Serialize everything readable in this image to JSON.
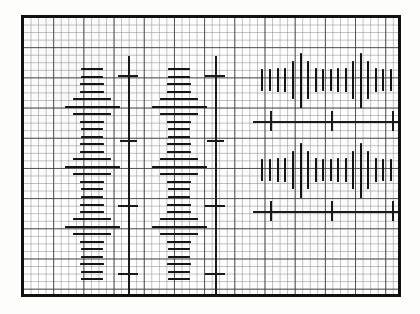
{
  "figure": {
    "title": "Graph-paper bar chart with diamond-shaped bar clusters",
    "background_color": "#ffffff",
    "ink_color": "#141414",
    "frame_color": "#111111",
    "grid_minor_color": "#8c8c8c",
    "grid_major_color": "#3c3c3c",
    "grid_minor_step_px": 7.55,
    "grid_major_step_px": 30.2,
    "plot_left_px": 21,
    "plot_top_px": 15,
    "plot_width_px": 380,
    "plot_height_px": 282
  },
  "chart_data": {
    "type": "bar",
    "title": "Graph-paper bar chart with diamond-shaped bar clusters",
    "subtitle": "",
    "xlabel": "",
    "ylabel": "",
    "grid": true,
    "legend": "none",
    "xlim": [
      0,
      380
    ],
    "ylim": [
      0,
      282
    ],
    "panels": [
      {
        "name": "left-column-1",
        "orientation": "horizontal",
        "center_x": 68,
        "clusters": [
          {
            "name": "cluster-A1",
            "center_y": 78,
            "bars": [
              {
                "y": 50,
                "length": 22
              },
              {
                "y": 58,
                "length": 22
              },
              {
                "y": 65,
                "length": 24
              },
              {
                "y": 73,
                "length": 24
              },
              {
                "y": 80,
                "length": 38
              },
              {
                "y": 88,
                "length": 55
              },
              {
                "y": 95,
                "length": 38
              },
              {
                "y": 103,
                "length": 24
              },
              {
                "y": 110,
                "length": 22
              },
              {
                "y": 118,
                "length": 22
              },
              {
                "y": 125,
                "length": 24
              },
              {
                "y": 133,
                "length": 24
              }
            ]
          },
          {
            "name": "cluster-A2",
            "center_y": 148,
            "bars": [
              {
                "y": 140,
                "length": 38
              },
              {
                "y": 148,
                "length": 55
              },
              {
                "y": 155,
                "length": 38
              },
              {
                "y": 163,
                "length": 24
              },
              {
                "y": 170,
                "length": 22
              },
              {
                "y": 178,
                "length": 22
              }
            ]
          },
          {
            "name": "cluster-A3",
            "center_y": 208,
            "bars": [
              {
                "y": 186,
                "length": 24
              },
              {
                "y": 193,
                "length": 24
              },
              {
                "y": 200,
                "length": 38
              },
              {
                "y": 208,
                "length": 55
              },
              {
                "y": 215,
                "length": 38
              },
              {
                "y": 223,
                "length": 24
              },
              {
                "y": 230,
                "length": 22
              },
              {
                "y": 238,
                "length": 22
              },
              {
                "y": 245,
                "length": 24
              },
              {
                "y": 253,
                "length": 22
              },
              {
                "y": 260,
                "length": 22
              }
            ]
          }
        ],
        "axis": {
          "name": "axis-left-1",
          "x": 104,
          "y_top": 38,
          "y_bottom": 281,
          "ticks": [
            {
              "y": 57,
              "length": 20
            },
            {
              "y": 122,
              "length": 17
            },
            {
              "y": 187,
              "length": 20
            },
            {
              "y": 255,
              "length": 20
            }
          ]
        }
      },
      {
        "name": "left-column-2",
        "orientation": "horizontal",
        "center_x": 155,
        "clusters": [
          {
            "name": "cluster-B1",
            "center_y": 78,
            "bars": [
              {
                "y": 50,
                "length": 22
              },
              {
                "y": 58,
                "length": 22
              },
              {
                "y": 65,
                "length": 24
              },
              {
                "y": 73,
                "length": 24
              },
              {
                "y": 80,
                "length": 38
              },
              {
                "y": 88,
                "length": 55
              },
              {
                "y": 95,
                "length": 38
              },
              {
                "y": 103,
                "length": 24
              },
              {
                "y": 110,
                "length": 22
              },
              {
                "y": 118,
                "length": 22
              },
              {
                "y": 125,
                "length": 24
              },
              {
                "y": 133,
                "length": 24
              }
            ]
          },
          {
            "name": "cluster-B2",
            "center_y": 148,
            "bars": [
              {
                "y": 140,
                "length": 38
              },
              {
                "y": 148,
                "length": 55
              },
              {
                "y": 155,
                "length": 38
              },
              {
                "y": 163,
                "length": 24
              },
              {
                "y": 170,
                "length": 22
              },
              {
                "y": 178,
                "length": 22
              }
            ]
          },
          {
            "name": "cluster-B3",
            "center_y": 208,
            "bars": [
              {
                "y": 186,
                "length": 24
              },
              {
                "y": 193,
                "length": 24
              },
              {
                "y": 200,
                "length": 38
              },
              {
                "y": 208,
                "length": 55
              },
              {
                "y": 215,
                "length": 38
              },
              {
                "y": 223,
                "length": 24
              },
              {
                "y": 230,
                "length": 22
              },
              {
                "y": 238,
                "length": 22
              },
              {
                "y": 245,
                "length": 24
              },
              {
                "y": 253,
                "length": 22
              },
              {
                "y": 260,
                "length": 22
              }
            ]
          }
        ],
        "axis": {
          "name": "axis-left-2",
          "x": 191,
          "y_top": 38,
          "y_bottom": 281,
          "ticks": [
            {
              "y": 57,
              "length": 20
            },
            {
              "y": 122,
              "length": 17
            },
            {
              "y": 187,
              "length": 20
            },
            {
              "y": 255,
              "length": 20
            }
          ]
        }
      },
      {
        "name": "right-row-1",
        "orientation": "vertical",
        "center_y": 62,
        "clusters": [
          {
            "name": "cluster-C1",
            "center_x": 268,
            "bars": [
              {
                "x": 237,
                "length": 22
              },
              {
                "x": 245,
                "length": 22
              },
              {
                "x": 253,
                "length": 24
              },
              {
                "x": 260,
                "length": 24
              },
              {
                "x": 268,
                "length": 38
              },
              {
                "x": 276,
                "length": 55
              },
              {
                "x": 283,
                "length": 38
              },
              {
                "x": 291,
                "length": 24
              },
              {
                "x": 298,
                "length": 22
              },
              {
                "x": 306,
                "length": 22
              },
              {
                "x": 313,
                "length": 24
              },
              {
                "x": 321,
                "length": 24
              }
            ]
          },
          {
            "name": "cluster-C2",
            "center_x": 345,
            "bars": [
              {
                "x": 328,
                "length": 38
              },
              {
                "x": 336,
                "length": 55
              },
              {
                "x": 343,
                "length": 38
              },
              {
                "x": 351,
                "length": 24
              },
              {
                "x": 358,
                "length": 22
              },
              {
                "x": 366,
                "length": 22
              }
            ]
          }
        ],
        "axis": {
          "name": "axis-right-1",
          "y": 103,
          "x_left": 229,
          "x_right": 383,
          "ticks": [
            {
              "x": 246,
              "length": 20
            },
            {
              "x": 307,
              "length": 20
            },
            {
              "x": 368,
              "length": 20
            }
          ]
        }
      },
      {
        "name": "right-row-2",
        "orientation": "vertical",
        "center_y": 152,
        "clusters": [
          {
            "name": "cluster-D1",
            "center_x": 268,
            "bars": [
              {
                "x": 237,
                "length": 22
              },
              {
                "x": 245,
                "length": 22
              },
              {
                "x": 253,
                "length": 24
              },
              {
                "x": 260,
                "length": 24
              },
              {
                "x": 268,
                "length": 38
              },
              {
                "x": 276,
                "length": 55
              },
              {
                "x": 283,
                "length": 38
              },
              {
                "x": 291,
                "length": 24
              },
              {
                "x": 298,
                "length": 22
              },
              {
                "x": 306,
                "length": 22
              },
              {
                "x": 313,
                "length": 24
              },
              {
                "x": 321,
                "length": 24
              }
            ]
          },
          {
            "name": "cluster-D2",
            "center_x": 345,
            "bars": [
              {
                "x": 328,
                "length": 38
              },
              {
                "x": 336,
                "length": 55
              },
              {
                "x": 343,
                "length": 38
              },
              {
                "x": 351,
                "length": 24
              },
              {
                "x": 358,
                "length": 22
              },
              {
                "x": 366,
                "length": 22
              }
            ]
          }
        ],
        "axis": {
          "name": "axis-right-2",
          "y": 193,
          "x_left": 229,
          "x_right": 383,
          "ticks": [
            {
              "x": 246,
              "length": 20
            },
            {
              "x": 307,
              "length": 20
            },
            {
              "x": 368,
              "length": 20
            }
          ]
        }
      }
    ]
  }
}
